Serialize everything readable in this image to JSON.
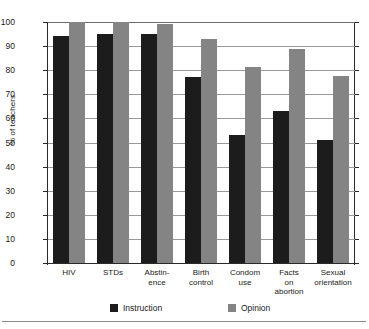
{
  "chart_data": {
    "type": "bar",
    "title": "",
    "xlabel": "",
    "ylabel": "% of teachers",
    "ylim": [
      0,
      100
    ],
    "ytick_values": [
      0,
      10,
      20,
      30,
      40,
      50,
      60,
      70,
      80,
      90,
      100
    ],
    "ytick_labels": [
      "0",
      "10",
      "20",
      "30",
      "40",
      "50",
      "60",
      "70",
      "80",
      "90",
      "100"
    ],
    "grid": true,
    "grid_axis": "y",
    "legend_position": "bottom",
    "categories": [
      "HIV",
      "STDs",
      "Abstin-\nence",
      "Birth\ncontrol",
      "Condom\nuse",
      "Facts\non\nabortion",
      "Sexual\norientation"
    ],
    "category_lines": [
      [
        "HIV"
      ],
      [
        "STDs"
      ],
      [
        "Abstin-",
        "ence"
      ],
      [
        "Birth",
        "control"
      ],
      [
        "Condom",
        "use"
      ],
      [
        "Facts",
        "on",
        "abortion"
      ],
      [
        "Sexual",
        "orientation"
      ]
    ],
    "series": [
      {
        "name": "Instruction",
        "color": "#1c1c1c",
        "values": [
          94,
          95,
          95,
          77,
          53,
          63,
          51
        ]
      },
      {
        "name": "Opinion",
        "color": "#848484",
        "values": [
          100,
          100,
          99,
          93,
          81.5,
          89,
          77.5
        ]
      }
    ]
  },
  "legend": {
    "entries": [
      {
        "label": "Instruction",
        "color": "#1c1c1c"
      },
      {
        "label": "Opinion",
        "color": "#848484"
      }
    ]
  },
  "colors": {
    "instruction": "#1c1c1c",
    "opinion": "#848484",
    "axis": "#2a2a2a",
    "gridline": "#9a9a9a",
    "background": "#ffffff"
  }
}
